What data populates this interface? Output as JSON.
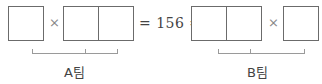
{
  "equation": {
    "left": {
      "single_box": "blank",
      "operator": "×",
      "double_box": [
        "blank",
        "blank"
      ],
      "group_label": "A팀"
    },
    "equals": "=",
    "result": "156",
    "right": {
      "double_box": [
        "blank",
        "blank"
      ],
      "operator": "×",
      "single_box": "blank",
      "group_label": "B팀"
    }
  },
  "text": {
    "mid": "= 156 ="
  }
}
